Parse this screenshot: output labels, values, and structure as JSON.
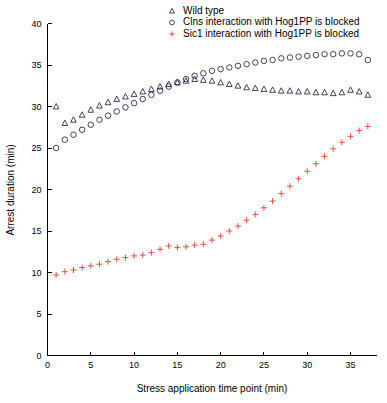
{
  "chart_data": {
    "type": "scatter",
    "title": "",
    "xlabel": "Stress application time point (min)",
    "ylabel": "Arrest duration (min)",
    "xlim": [
      0,
      38
    ],
    "ylim": [
      0,
      40
    ],
    "xticks": [
      0,
      5,
      10,
      15,
      20,
      25,
      30,
      35
    ],
    "yticks": [
      0,
      5,
      10,
      15,
      20,
      25,
      30,
      35,
      40
    ],
    "grid": false,
    "legend_position": "top-right",
    "x": [
      1,
      2,
      3,
      4,
      5,
      6,
      7,
      8,
      9,
      10,
      11,
      12,
      13,
      14,
      15,
      16,
      17,
      18,
      19,
      20,
      21,
      22,
      23,
      24,
      25,
      26,
      27,
      28,
      29,
      30,
      31,
      32,
      33,
      34,
      35,
      36,
      37
    ],
    "series": [
      {
        "name": "Wild type",
        "marker": "triangle",
        "color": "#2a2d50",
        "values": [
          30.0,
          28.0,
          28.4,
          29.0,
          29.6,
          30.1,
          30.5,
          30.9,
          31.2,
          31.5,
          31.8,
          32.1,
          32.4,
          32.7,
          32.9,
          33.1,
          33.3,
          33.2,
          33.1,
          32.9,
          32.7,
          32.5,
          32.3,
          32.2,
          32.1,
          32.0,
          31.9,
          31.9,
          31.8,
          31.8,
          31.7,
          31.7,
          31.6,
          31.7,
          32.0,
          31.8,
          31.4
        ]
      },
      {
        "name": "Clns interaction with Hog1PP is blocked",
        "marker": "circle",
        "color": "#2a2d50",
        "values": [
          25.0,
          26.0,
          26.6,
          27.2,
          27.8,
          28.4,
          28.9,
          29.4,
          29.9,
          30.4,
          30.9,
          31.4,
          31.9,
          32.4,
          32.9,
          33.3,
          33.7,
          34.0,
          34.3,
          34.5,
          34.7,
          34.9,
          35.1,
          35.3,
          35.5,
          35.6,
          35.8,
          35.9,
          36.0,
          36.1,
          36.2,
          36.3,
          36.3,
          36.4,
          36.4,
          36.3,
          35.6
        ]
      },
      {
        "name": "Sic1 interaction with Hog1PP is blocked",
        "marker": "plus",
        "color": "#e8402a",
        "values": [
          9.7,
          10.1,
          10.3,
          10.6,
          10.8,
          11.0,
          11.3,
          11.6,
          11.8,
          12.0,
          12.1,
          12.4,
          12.8,
          13.2,
          13.0,
          13.1,
          13.3,
          13.4,
          13.9,
          14.4,
          15.0,
          15.6,
          16.3,
          17.0,
          17.8,
          18.6,
          19.5,
          20.4,
          21.3,
          22.2,
          23.1,
          24.0,
          24.9,
          25.7,
          26.4,
          27.1,
          27.6
        ]
      }
    ]
  },
  "axes": {
    "x_title": "Stress application time point (min)",
    "y_title": "Arrest duration (min)"
  },
  "legend": {
    "entries": [
      {
        "label": "Wild type",
        "marker": "triangle-marker",
        "color": "#2a2d50"
      },
      {
        "label": "Clns interaction with Hog1PP is blocked",
        "marker": "circle-marker",
        "color": "#2a2d50"
      },
      {
        "label": "Sic1 interaction with Hog1PP is blocked",
        "marker": "plus-marker",
        "color": "#e8402a"
      }
    ]
  }
}
